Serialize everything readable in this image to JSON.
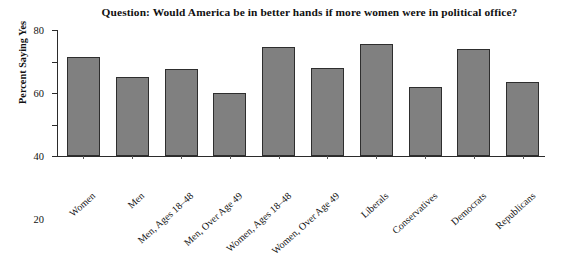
{
  "chart_data": {
    "type": "bar",
    "title": "Question: Would America be in better hands if more women were in political office?",
    "xlabel": "",
    "ylabel": "Percent Saying Yes",
    "ylim": [
      0,
      80
    ],
    "yticks": [
      0,
      20,
      40,
      60,
      80
    ],
    "ytick_labels": [
      "0",
      "20",
      "40",
      "60",
      "80"
    ],
    "grid": false,
    "legend": false,
    "bar_color": "#808080",
    "bar_edge_color": "#2e2e2e",
    "background_color": "#ffffff",
    "axis_color": "#2b2b2b",
    "categories": [
      "Women",
      "Men",
      "Men, Ages 18–48",
      "Men, Over Age 49",
      "Women, Ages 18–48",
      "Women, Over Age 49",
      "Liberals",
      "Conservatives",
      "Democrats",
      "Republicans"
    ],
    "values": [
      63,
      50,
      55,
      40,
      69,
      56,
      71,
      44,
      68,
      47
    ]
  }
}
